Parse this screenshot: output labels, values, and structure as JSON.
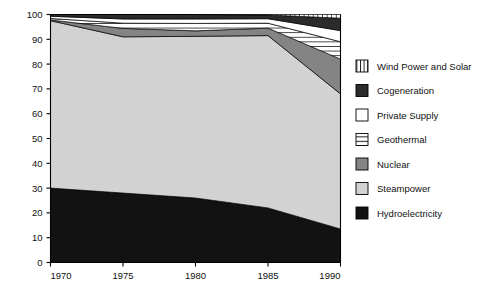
{
  "chart_data": {
    "type": "area",
    "stacked": true,
    "title": "",
    "subtitle": "",
    "xlabel": "",
    "ylabel": "",
    "x": [
      1970,
      1975,
      1980,
      1985,
      1990
    ],
    "xticks": [
      "1970",
      "1975",
      "1980",
      "1985",
      "1990"
    ],
    "xlim": [
      1970,
      1990
    ],
    "ylim": [
      0,
      100
    ],
    "yticks": [
      "0",
      "10",
      "20",
      "30",
      "40",
      "50",
      "60",
      "70",
      "80",
      "90",
      "100"
    ],
    "ytick_values": [
      0,
      10,
      20,
      30,
      40,
      50,
      60,
      70,
      80,
      90,
      100
    ],
    "grid": false,
    "legend_position": "right",
    "series": [
      {
        "name": "Hydroelectricity",
        "fill": "#121212",
        "pattern": "solid",
        "values": [
          30.0,
          28.0,
          26.0,
          22.0,
          13.5
        ]
      },
      {
        "name": "Steampower",
        "fill": "#d2d2d2",
        "pattern": "solid",
        "values": [
          67.5,
          63.0,
          65.2,
          69.5,
          54.5
        ]
      },
      {
        "name": "Nuclear",
        "fill": "#848484",
        "pattern": "solid",
        "values": [
          0.3,
          3.4,
          2.2,
          3.0,
          14.0
        ]
      },
      {
        "name": "Geothermal",
        "fill": "#ffffff",
        "pattern": "horizontal-lines",
        "values": [
          0.6,
          2.1,
          3.0,
          2.0,
          7.0
        ]
      },
      {
        "name": "Private Supply",
        "fill": "#ffffff",
        "pattern": "none",
        "values": [
          0.9,
          1.7,
          1.8,
          1.8,
          4.5
        ]
      },
      {
        "name": "Cogeneration",
        "fill": "#2b2b2b",
        "pattern": "solid",
        "values": [
          0.7,
          1.8,
          1.8,
          1.5,
          5.0
        ]
      },
      {
        "name": "Wind Power and Solar",
        "fill": "#ffffff",
        "pattern": "vertical-lines",
        "values": [
          0.0,
          0.0,
          0.0,
          0.2,
          1.5
        ]
      }
    ]
  },
  "legend": {
    "items": [
      {
        "label": "Wind Power and Solar",
        "swatch": "wind-power-and-solar-swatch"
      },
      {
        "label": "Cogeneration",
        "swatch": "cogeneration-swatch"
      },
      {
        "label": "Private Supply",
        "swatch": "private-supply-swatch"
      },
      {
        "label": "Geothermal",
        "swatch": "geothermal-swatch"
      },
      {
        "label": "Nuclear",
        "swatch": "nuclear-swatch"
      },
      {
        "label": "Steampower",
        "swatch": "steampower-swatch"
      },
      {
        "label": "Hydroelectricity",
        "swatch": "hydroelectricity-swatch"
      }
    ]
  },
  "colors": {
    "axis": "#000000",
    "background": "#ffffff",
    "hydroelectricity": "#121212",
    "steampower": "#d2d2d2",
    "nuclear": "#848484",
    "cogeneration": "#2b2b2b",
    "white_fill": "#ffffff"
  }
}
